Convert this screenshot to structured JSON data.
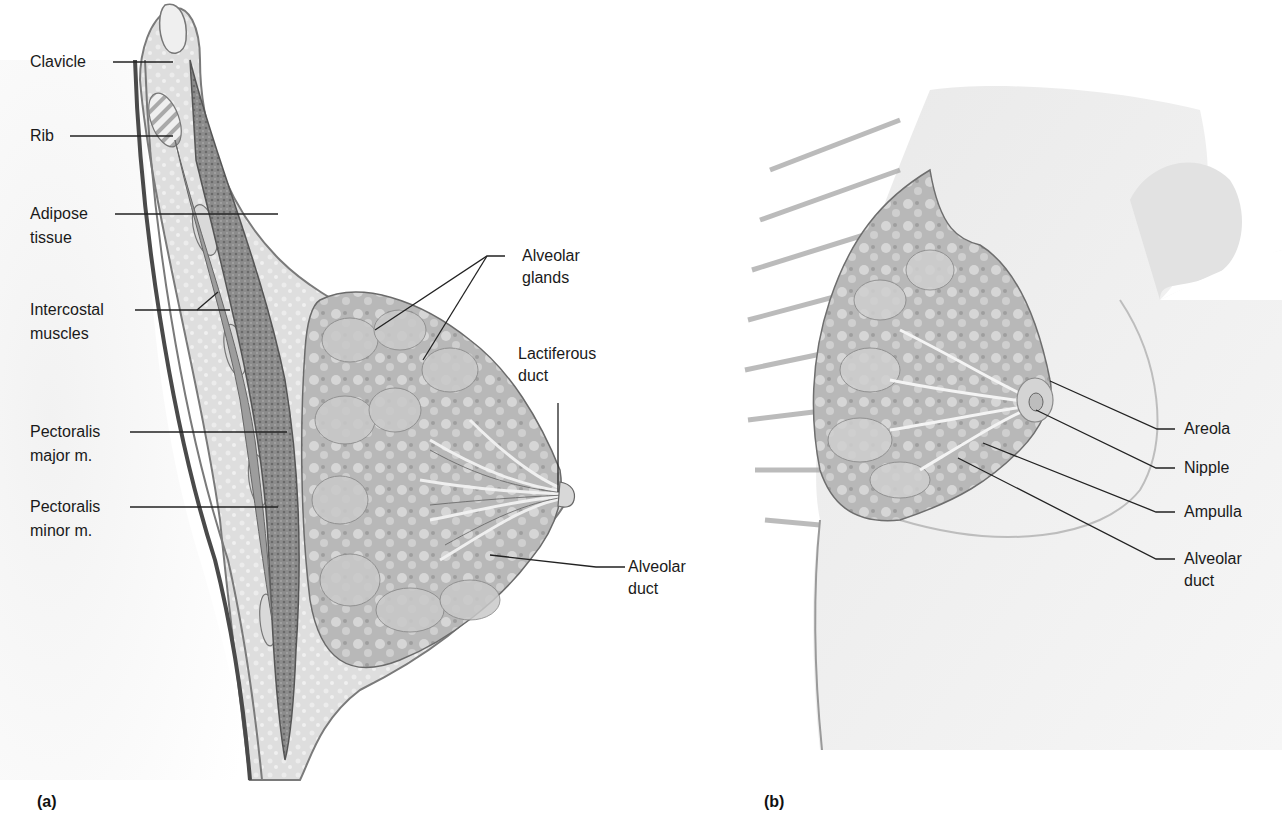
{
  "figure": {
    "panels": [
      {
        "id": "a",
        "label": "(a)",
        "view": "sagittal section",
        "callouts": [
          {
            "line1": "Clavicle",
            "line2": ""
          },
          {
            "line1": "Rib",
            "line2": ""
          },
          {
            "line1": "Adipose",
            "line2": "tissue"
          },
          {
            "line1": "Intercostal",
            "line2": "muscles"
          },
          {
            "line1": "Pectoralis",
            "line2": "major m."
          },
          {
            "line1": "Pectoralis",
            "line2": "minor m."
          },
          {
            "line1": "Alveolar",
            "line2": "glands"
          },
          {
            "line1": "Lactiferous",
            "line2": "duct"
          },
          {
            "line1": "Alveolar",
            "line2": "duct"
          }
        ]
      },
      {
        "id": "b",
        "label": "(b)",
        "view": "anterior view",
        "callouts": [
          {
            "line1": "Areola",
            "line2": ""
          },
          {
            "line1": "Nipple",
            "line2": ""
          },
          {
            "line1": "Ampulla",
            "line2": ""
          },
          {
            "line1": "Alveolar",
            "line2": "duct"
          }
        ]
      }
    ],
    "colors": {
      "background": "#ffffff",
      "label_text": "#1a1a1a",
      "leader_line": "#222222",
      "tissue_light": "#e4e4e4",
      "tissue_mid": "#b8b8b8",
      "tissue_dark": "#6a6a6a"
    }
  }
}
